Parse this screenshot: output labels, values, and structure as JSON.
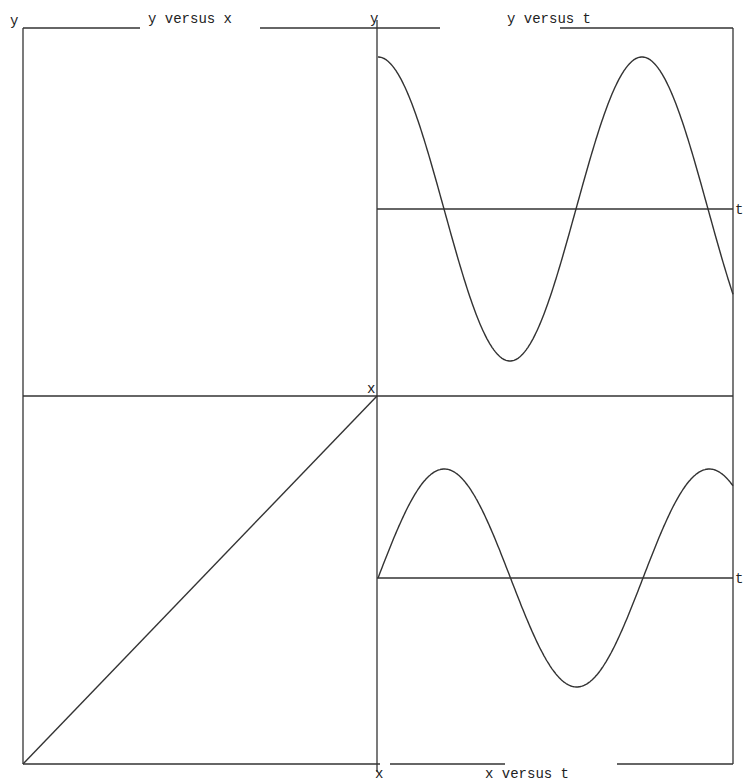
{
  "chart_data": [
    {
      "type": "line",
      "title": "y versus x",
      "xlabel": "x",
      "ylabel": "y",
      "description": "Empty frame (no curve drawn)",
      "series": []
    },
    {
      "type": "line",
      "title": "y versus t",
      "xlabel": "t",
      "ylabel": "y",
      "series": [
        {
          "name": "y(t)",
          "shape": "cosine",
          "amplitude_rel": 1.0,
          "periods_shown": 1.35
        }
      ]
    },
    {
      "type": "line",
      "title": "x versus y",
      "xlabel": "x",
      "ylabel": "y",
      "series": [
        {
          "name": "diagonal",
          "points": [
            [
              0,
              0
            ],
            [
              1,
              1
            ]
          ]
        }
      ]
    },
    {
      "type": "line",
      "title": "x versus t",
      "xlabel": "t",
      "ylabel": "x",
      "series": [
        {
          "name": "x(t)",
          "shape": "sine",
          "amplitude_rel": 0.72,
          "periods_shown": 1.34
        }
      ]
    }
  ],
  "labels": {
    "top_left_y": "y",
    "top_left_title": "y versus x",
    "top_right_y": "y",
    "top_right_title": "y versus t",
    "top_right_t": "t",
    "mid_x": "x",
    "bottom_right_t": "t",
    "bottom_x": "x",
    "bottom_title": "x versus t"
  }
}
